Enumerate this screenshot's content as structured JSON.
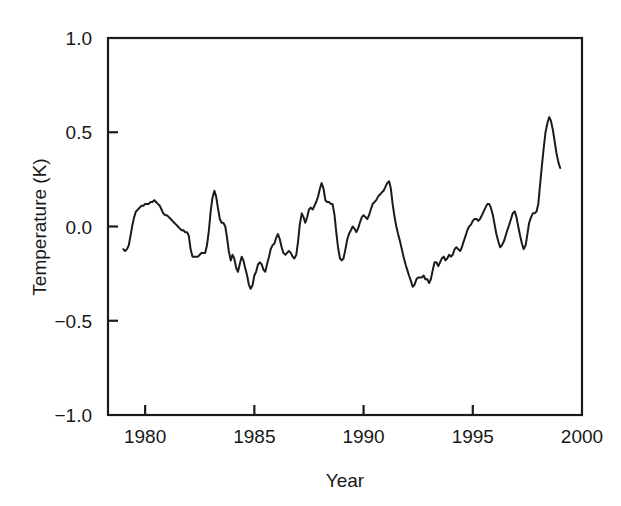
{
  "chart_data": {
    "type": "line",
    "title": "",
    "subtitle": "",
    "xlabel": "Year",
    "ylabel": "Temperature (K)",
    "xlim": [
      1978.3,
      2000.0
    ],
    "ylim": [
      -1.0,
      1.0
    ],
    "grid": false,
    "legend": "none",
    "xticks": [
      1980,
      1985,
      1990,
      1995,
      2000
    ],
    "xtick_labels": [
      "1980",
      "1985",
      "1990",
      "1995",
      "2000"
    ],
    "yticks": [
      -1.0,
      -0.5,
      0.0,
      0.5,
      1.0
    ],
    "ytick_labels": [
      "−1.0",
      "−0.5",
      "0.0",
      "0.5",
      "1.0"
    ],
    "series": [
      {
        "name": "Temperature anomaly",
        "color": "#1b1b1b",
        "x": [
          1979.0,
          1979.08,
          1979.17,
          1979.25,
          1979.33,
          1979.42,
          1979.5,
          1979.58,
          1979.67,
          1979.75,
          1979.83,
          1979.92,
          1980.0,
          1980.08,
          1980.17,
          1980.25,
          1980.33,
          1980.42,
          1980.5,
          1980.58,
          1980.67,
          1980.75,
          1980.83,
          1980.92,
          1981.0,
          1981.08,
          1981.17,
          1981.25,
          1981.33,
          1981.42,
          1981.5,
          1981.58,
          1981.67,
          1981.75,
          1981.83,
          1981.92,
          1982.0,
          1982.08,
          1982.17,
          1982.25,
          1982.33,
          1982.42,
          1982.5,
          1982.58,
          1982.67,
          1982.75,
          1982.83,
          1982.92,
          1983.0,
          1983.08,
          1983.17,
          1983.25,
          1983.33,
          1983.42,
          1983.5,
          1983.58,
          1983.67,
          1983.75,
          1983.83,
          1983.92,
          1984.0,
          1984.08,
          1984.17,
          1984.25,
          1984.33,
          1984.42,
          1984.5,
          1984.58,
          1984.67,
          1984.75,
          1984.83,
          1984.92,
          1985.0,
          1985.08,
          1985.17,
          1985.25,
          1985.33,
          1985.42,
          1985.5,
          1985.58,
          1985.67,
          1985.75,
          1985.83,
          1985.92,
          1986.0,
          1986.08,
          1986.17,
          1986.25,
          1986.33,
          1986.42,
          1986.5,
          1986.58,
          1986.67,
          1986.75,
          1986.83,
          1986.92,
          1987.0,
          1987.08,
          1987.17,
          1987.25,
          1987.33,
          1987.42,
          1987.5,
          1987.58,
          1987.67,
          1987.75,
          1987.83,
          1987.92,
          1988.0,
          1988.08,
          1988.17,
          1988.25,
          1988.33,
          1988.42,
          1988.5,
          1988.58,
          1988.67,
          1988.75,
          1988.83,
          1988.92,
          1989.0,
          1989.08,
          1989.17,
          1989.25,
          1989.33,
          1989.42,
          1989.5,
          1989.58,
          1989.67,
          1989.75,
          1989.83,
          1989.92,
          1990.0,
          1990.08,
          1990.17,
          1990.25,
          1990.33,
          1990.42,
          1990.5,
          1990.58,
          1990.67,
          1990.75,
          1990.83,
          1990.92,
          1991.0,
          1991.08,
          1991.17,
          1991.25,
          1991.33,
          1991.42,
          1991.5,
          1991.58,
          1991.67,
          1991.75,
          1991.83,
          1991.92,
          1992.0,
          1992.08,
          1992.17,
          1992.25,
          1992.33,
          1992.42,
          1992.5,
          1992.58,
          1992.67,
          1992.75,
          1992.83,
          1992.92,
          1993.0,
          1993.08,
          1993.17,
          1993.25,
          1993.33,
          1993.42,
          1993.5,
          1993.58,
          1993.67,
          1993.75,
          1993.83,
          1993.92,
          1994.0,
          1994.08,
          1994.17,
          1994.25,
          1994.33,
          1994.42,
          1994.5,
          1994.58,
          1994.67,
          1994.75,
          1994.83,
          1994.92,
          1995.0,
          1995.08,
          1995.17,
          1995.25,
          1995.33,
          1995.42,
          1995.5,
          1995.58,
          1995.67,
          1995.75,
          1995.83,
          1995.92,
          1996.0,
          1996.08,
          1996.17,
          1996.25,
          1996.33,
          1996.42,
          1996.5,
          1996.58,
          1996.67,
          1996.75,
          1996.83,
          1996.92,
          1997.0,
          1997.08,
          1997.17,
          1997.25,
          1997.33,
          1997.42,
          1997.5,
          1997.58,
          1997.67,
          1997.75,
          1997.83,
          1997.92,
          1998.0,
          1998.08,
          1998.17,
          1998.25,
          1998.33,
          1998.42,
          1998.5,
          1998.58,
          1998.67,
          1998.75,
          1998.83,
          1998.92,
          1999.0
        ],
        "y": [
          -0.12,
          -0.13,
          -0.12,
          -0.1,
          -0.05,
          0.01,
          0.05,
          0.08,
          0.09,
          0.1,
          0.11,
          0.11,
          0.12,
          0.12,
          0.12,
          0.13,
          0.13,
          0.14,
          0.13,
          0.12,
          0.11,
          0.09,
          0.07,
          0.06,
          0.06,
          0.05,
          0.04,
          0.03,
          0.02,
          0.01,
          0.0,
          -0.01,
          -0.02,
          -0.02,
          -0.03,
          -0.03,
          -0.05,
          -0.12,
          -0.16,
          -0.16,
          -0.16,
          -0.16,
          -0.15,
          -0.14,
          -0.14,
          -0.14,
          -0.1,
          -0.02,
          0.08,
          0.15,
          0.19,
          0.16,
          0.1,
          0.04,
          0.02,
          0.02,
          0.0,
          -0.06,
          -0.13,
          -0.18,
          -0.15,
          -0.17,
          -0.22,
          -0.24,
          -0.2,
          -0.16,
          -0.18,
          -0.22,
          -0.26,
          -0.31,
          -0.33,
          -0.31,
          -0.26,
          -0.24,
          -0.2,
          -0.19,
          -0.2,
          -0.23,
          -0.24,
          -0.2,
          -0.16,
          -0.12,
          -0.1,
          -0.09,
          -0.06,
          -0.04,
          -0.07,
          -0.11,
          -0.14,
          -0.15,
          -0.14,
          -0.13,
          -0.14,
          -0.16,
          -0.17,
          -0.15,
          -0.08,
          0.01,
          0.07,
          0.05,
          0.02,
          0.05,
          0.09,
          0.1,
          0.09,
          0.11,
          0.13,
          0.16,
          0.2,
          0.23,
          0.2,
          0.14,
          0.13,
          0.13,
          0.12,
          0.12,
          0.06,
          -0.03,
          -0.11,
          -0.17,
          -0.18,
          -0.17,
          -0.12,
          -0.07,
          -0.04,
          -0.02,
          0.0,
          -0.01,
          -0.03,
          -0.01,
          0.02,
          0.05,
          0.06,
          0.05,
          0.04,
          0.06,
          0.09,
          0.12,
          0.13,
          0.14,
          0.16,
          0.17,
          0.18,
          0.19,
          0.21,
          0.23,
          0.24,
          0.2,
          0.12,
          0.05,
          0.0,
          -0.04,
          -0.08,
          -0.12,
          -0.16,
          -0.2,
          -0.23,
          -0.26,
          -0.29,
          -0.32,
          -0.31,
          -0.28,
          -0.27,
          -0.27,
          -0.27,
          -0.26,
          -0.28,
          -0.28,
          -0.3,
          -0.28,
          -0.23,
          -0.19,
          -0.19,
          -0.21,
          -0.19,
          -0.17,
          -0.16,
          -0.18,
          -0.17,
          -0.15,
          -0.16,
          -0.15,
          -0.12,
          -0.11,
          -0.12,
          -0.13,
          -0.11,
          -0.08,
          -0.05,
          -0.02,
          0.0,
          0.01,
          0.03,
          0.04,
          0.04,
          0.03,
          0.04,
          0.06,
          0.08,
          0.1,
          0.12,
          0.12,
          0.1,
          0.06,
          0.01,
          -0.04,
          -0.08,
          -0.11,
          -0.1,
          -0.08,
          -0.05,
          -0.02,
          0.01,
          0.04,
          0.07,
          0.08,
          0.05,
          0.0,
          -0.05,
          -0.09,
          -0.12,
          -0.1,
          -0.04,
          0.02,
          0.05,
          0.07,
          0.07,
          0.08,
          0.12,
          0.22,
          0.33,
          0.42,
          0.5,
          0.55,
          0.58,
          0.56,
          0.51,
          0.45,
          0.39,
          0.34,
          0.31
        ]
      }
    ]
  },
  "axes": {
    "y_label": "Temperature (K)",
    "x_label": "Year"
  }
}
